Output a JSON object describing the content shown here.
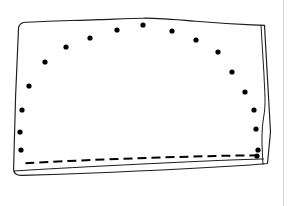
{
  "figure": {
    "title": "Fabric panel outline with dotted placement arc and dashed hem",
    "caption": "",
    "background_color": "#ffffff",
    "ink_color": "#1b1b1b",
    "dot_color": "#000000",
    "rule_color": "#d6d6d6",
    "canvas": {
      "width": 289,
      "height": 206
    }
  },
  "chart_data": {
    "type": "scatter",
    "title": "Fabric panel outline with dotted placement arc and dashed hem",
    "xlabel": "",
    "ylabel": "",
    "xlim": [
      0,
      289
    ],
    "ylim": [
      0,
      206
    ],
    "grid": false,
    "legend": "none",
    "series": [
      {
        "name": "marker-dots",
        "marker": "filled-circle",
        "marker_radius": 2.6,
        "color": "#000000",
        "count": 18,
        "points": [
          [
            21,
            150
          ],
          [
            20,
            132
          ],
          [
            22,
            110
          ],
          [
            29,
            86
          ],
          [
            45,
            62
          ],
          [
            66,
            47
          ],
          [
            90,
            38
          ],
          [
            117,
            30
          ],
          [
            143,
            25
          ],
          [
            172,
            31
          ],
          [
            196,
            40
          ],
          [
            218,
            52
          ],
          [
            232,
            72
          ],
          [
            245,
            92
          ],
          [
            254,
            110
          ],
          [
            256,
            129
          ],
          [
            258,
            150
          ],
          [
            257,
            156
          ]
        ]
      }
    ],
    "paths": [
      {
        "name": "panel-outline",
        "style": "solid",
        "stroke_width": 1.15,
        "closed": true
      },
      {
        "name": "right-fold-line",
        "style": "solid",
        "stroke_width": 1.0,
        "closed": false
      },
      {
        "name": "bottom-fold-line",
        "style": "solid",
        "stroke_width": 1.0,
        "closed": false
      },
      {
        "name": "hem-stitch-line",
        "style": "dashed",
        "stroke_width": 2.0,
        "dash_pattern": "9 5",
        "closed": false
      }
    ],
    "annotations": []
  },
  "geometry": {
    "panel_outline_path": "M 18.5 28.5 C 18.8 24.6 21.6 22.6 25.5 22.3 C 45 21.2 72 20.6 99 19.6 C 117 19.0 131 18.4 143 18.2 C 158 18.0 176 19.6 196 21.3 C 216 23.0 238 24.3 252 24.9 L 264.5 25.4 L 270.5 132.0 L 267.5 163.5 L 250 165.0 C 200 168.2 120 172.0 60 174.2 L 22.0 175.4 C 16.0 175.6 13.4 173.0 13.6 169.0 L 15.6 96.0 Z",
    "right_fold_path": "M 261.0 25.2 L 264.0 75.0 C 264.6 92.0 266.2 104.0 263.5 118.0 C 261.6 128.0 261.8 142.0 262.3 152.0 L 263.0 164.2",
    "bottom_fold_path": "M 14.0 171.0 C 50 168.6 140 164.0 200 161.3 C 228 160.0 250 159.3 263.5 159.0",
    "hem_stitch_path": "M 25.5 163.2 C 70 160.6 140 158.0 190 156.6 C 222 155.7 246 155.4 261.5 155.3",
    "page_rule_x": 283.5
  },
  "labels": {
    "figure_region": "technical line drawing",
    "panel": "fabric panel",
    "fold": "folded edge",
    "hem": "dashed hem stitch line",
    "dots": "placement marker dots"
  }
}
